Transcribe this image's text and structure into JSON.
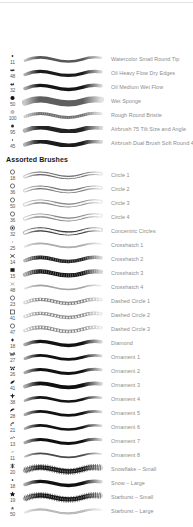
{
  "panel": {
    "title": "Brushes",
    "background": "#ffffff",
    "label_color": "#8c8c8c",
    "header_color": "#1a1a1a",
    "divider_color": "#e3e3e3"
  },
  "groups": [
    {
      "name": "",
      "header_visible": false,
      "brushes": [
        {
          "name": "Watercolor Small Round Tip",
          "size": "11",
          "tip_icon": "dot-small-icon",
          "stroke": "tapered-medium",
          "ink": "#565656",
          "weight": 2.6,
          "texture": "smooth"
        },
        {
          "name": "Oil Heavy Flow Dry Edges",
          "size": "48",
          "tip_icon": "bristle-splat-icon",
          "stroke": "solid-dark",
          "ink": "#1b1b1b",
          "weight": 3.2,
          "texture": "smooth"
        },
        {
          "name": "Oil Medium Wet Flow",
          "size": "32",
          "tip_icon": "bristle-clump-icon",
          "stroke": "solid-dark",
          "ink": "#151515",
          "weight": 3.4,
          "texture": "smooth"
        },
        {
          "name": "Wet Sponge",
          "size": "50",
          "tip_icon": "round-solid-icon",
          "stroke": "thick-grey",
          "ink": "#5e5e5e",
          "weight": 6.2,
          "texture": "smooth"
        },
        {
          "name": "Rough Round Bristle",
          "size": "100",
          "tip_icon": "round-soft-icon",
          "stroke": "grainy-grey",
          "ink": "#6e6e6e",
          "weight": 3.0,
          "texture": "grain"
        },
        {
          "name": "Airbrush 75 Tilt Size and  Angle",
          "size": "95",
          "tip_icon": "dot-round-icon",
          "stroke": "soft-dark",
          "ink": "#232323",
          "weight": 4.4,
          "texture": "soft"
        },
        {
          "name": "Airbrush Dual Brush Soft Round 45",
          "size": "45",
          "tip_icon": "dot-tiny-icon",
          "stroke": "soft-dark",
          "ink": "#1c1c1c",
          "weight": 4.0,
          "texture": "soft"
        }
      ]
    },
    {
      "name": "Assorted Brushes",
      "header_visible": true,
      "brushes": [
        {
          "name": "Circle 1",
          "size": "18",
          "tip_icon": "circle-outline-icon",
          "stroke": "beaded-grey",
          "ink": "#6a6a6a",
          "weight": 3.6,
          "texture": "beads"
        },
        {
          "name": "Circle 2",
          "size": "36",
          "tip_icon": "circle-outline-icon",
          "stroke": "beaded-grey",
          "ink": "#777777",
          "weight": 3.8,
          "texture": "beads"
        },
        {
          "name": "Circle 3",
          "size": "50",
          "tip_icon": "circle-outline-icon",
          "stroke": "beaded-light",
          "ink": "#8a8a8a",
          "weight": 4.0,
          "texture": "beads"
        },
        {
          "name": "Circle 4",
          "size": "36",
          "tip_icon": "circle-outline-icon",
          "stroke": "beaded-light",
          "ink": "#8a8a8a",
          "weight": 4.0,
          "texture": "beads"
        },
        {
          "name": "Concentric Circles",
          "size": "32",
          "tip_icon": "concentric-circle-icon",
          "stroke": "beaded-dark",
          "ink": "#3d3d3d",
          "weight": 4.2,
          "texture": "beads"
        },
        {
          "name": "Crosshatch 1",
          "size": "25",
          "tip_icon": "crosshatch-dot-icon",
          "stroke": "faint-grey",
          "ink": "#a8a8a8",
          "weight": 1.8,
          "texture": "grain"
        },
        {
          "name": "Crosshatch 2",
          "size": "14",
          "tip_icon": "crosshatch-small-icon",
          "stroke": "rough-dark",
          "ink": "#1e1e1e",
          "weight": 3.6,
          "texture": "grain"
        },
        {
          "name": "Crosshatch 3",
          "size": "15",
          "tip_icon": "crosshatch-block-icon",
          "stroke": "rough-dark",
          "ink": "#141414",
          "weight": 4.2,
          "texture": "grain"
        },
        {
          "name": "Crosshatch 4",
          "size": "48",
          "tip_icon": "crosshatch-x-icon",
          "stroke": "faint-grey",
          "ink": "#9e9e9e",
          "weight": 1.6,
          "texture": "grain"
        },
        {
          "name": "Dashed Circle 1",
          "size": "23",
          "tip_icon": "circle-outline-icon",
          "stroke": "dashed-grey",
          "ink": "#828282",
          "weight": 3.4,
          "texture": "dash"
        },
        {
          "name": "Dashed Circle 2",
          "size": "41",
          "tip_icon": "square-outline-icon",
          "stroke": "dashed-grey",
          "ink": "#8c8c8c",
          "weight": 3.4,
          "texture": "dash"
        },
        {
          "name": "Dashed Circle 3",
          "size": "47",
          "tip_icon": "circle-outline-icon",
          "stroke": "dashed-grey",
          "ink": "#8c8c8c",
          "weight": 3.6,
          "texture": "dash"
        },
        {
          "name": "Diamond",
          "size": "18",
          "tip_icon": "diamond-dot-icon",
          "stroke": "solid-dark",
          "ink": "#121212",
          "weight": 3.4,
          "texture": "smooth"
        },
        {
          "name": "Ornament 1",
          "size": "27",
          "tip_icon": "ornament-w-icon",
          "stroke": "solid-dark",
          "ink": "#111111",
          "weight": 2.8,
          "texture": "smooth"
        },
        {
          "name": "Ornament 2",
          "size": "26",
          "tip_icon": "ornament-flower-icon",
          "stroke": "solid-dark",
          "ink": "#111111",
          "weight": 3.0,
          "texture": "smooth"
        },
        {
          "name": "Ornament 3",
          "size": "41",
          "tip_icon": "ornament-leaf-icon",
          "stroke": "solid-dark",
          "ink": "#101010",
          "weight": 3.8,
          "texture": "smooth"
        },
        {
          "name": "Ornament 4",
          "size": "38",
          "tip_icon": "ornament-cross-icon",
          "stroke": "solid-dark",
          "ink": "#141414",
          "weight": 2.6,
          "texture": "smooth"
        },
        {
          "name": "Ornament 5",
          "size": "28",
          "tip_icon": "ornament-bird-icon",
          "stroke": "solid-dark",
          "ink": "#121212",
          "weight": 2.8,
          "texture": "smooth"
        },
        {
          "name": "Ornament 6",
          "size": "21",
          "tip_icon": "ornament-swirl-icon",
          "stroke": "solid-dark",
          "ink": "#121212",
          "weight": 2.6,
          "texture": "smooth"
        },
        {
          "name": "Ornament 7",
          "size": "13",
          "tip_icon": "ornament-tilde-icon",
          "stroke": "solid-dark",
          "ink": "#101010",
          "weight": 3.0,
          "texture": "smooth"
        },
        {
          "name": "Ornament 8",
          "size": "11",
          "tip_icon": "ornament-speck-icon",
          "stroke": "thin-grey",
          "ink": "#4a4a4a",
          "weight": 1.8,
          "texture": "smooth"
        },
        {
          "name": "Snowflake – Small",
          "size": "20",
          "tip_icon": "snowflake-icon",
          "stroke": "bristly-dark",
          "ink": "#1a1a1a",
          "weight": 4.4,
          "texture": "bristle"
        },
        {
          "name": "Snow – Large",
          "size": "18",
          "tip_icon": "snow-dot-icon",
          "stroke": "solid-dark",
          "ink": "#111111",
          "weight": 3.4,
          "texture": "smooth"
        },
        {
          "name": "Starburst – Small",
          "size": "19",
          "tip_icon": "star-icon",
          "stroke": "bristly-dark",
          "ink": "#161616",
          "weight": 4.2,
          "texture": "bristle"
        },
        {
          "name": "Starburst – Large",
          "size": "50",
          "tip_icon": "star-small-icon",
          "stroke": "faint-grey",
          "ink": "#b4b4b4",
          "weight": 2.2,
          "texture": "grain"
        }
      ]
    }
  ]
}
